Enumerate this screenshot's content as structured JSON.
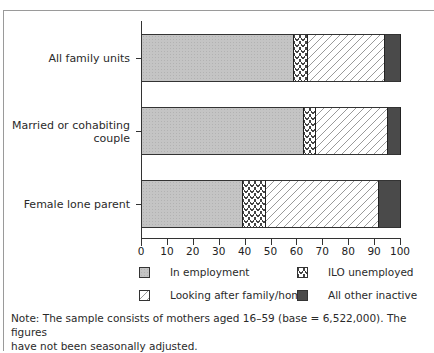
{
  "chart_data": {
    "type": "bar",
    "orientation": "horizontal",
    "stacked": true,
    "title": "",
    "xlabel": "",
    "ylabel": "",
    "xlim": [
      0,
      100
    ],
    "x_ticks": [
      0,
      10,
      20,
      30,
      40,
      50,
      60,
      70,
      80,
      90,
      100
    ],
    "grid": false,
    "legend_position": "bottom",
    "categories": [
      "All family units",
      "Married or cohabiting couple",
      "Female lone parent"
    ],
    "series": [
      {
        "name": "In employment",
        "values": [
          58.5,
          62.5,
          39.0
        ],
        "color": "#c4c4c4",
        "pattern": "dotted-grey"
      },
      {
        "name": "ILO unemployed",
        "values": [
          5.5,
          4.5,
          9.0
        ],
        "color": "#ffffff",
        "pattern": "wavy"
      },
      {
        "name": "Looking after family/home",
        "values": [
          30.0,
          28.0,
          43.5
        ],
        "color": "#ffffff",
        "pattern": "dashed-diagonal"
      },
      {
        "name": "All other inactive",
        "values": [
          6.0,
          5.0,
          8.5
        ],
        "color": "#4a4a4a",
        "pattern": "solid-dark"
      }
    ],
    "note": "Note: The sample consists of mothers aged 16–59 (base = 6,522,000). The figures have not been seasonally adjusted."
  },
  "labels": {
    "cat0": "All family units",
    "cat1a": "Married or cohabiting",
    "cat1b": "couple",
    "cat2": "Female lone parent"
  },
  "ticks": [
    "0",
    "10",
    "20",
    "30",
    "40",
    "50",
    "60",
    "70",
    "80",
    "90",
    "100"
  ],
  "legend": {
    "emp": "In employment",
    "ilo": "ILO unemployed",
    "look": "Looking after family/home",
    "other": "All other inactive"
  },
  "note_line1": "Note: The sample consists of mothers aged 16–59 (base = 6,522,000). The figures",
  "note_line2": "have not been seasonally adjusted."
}
